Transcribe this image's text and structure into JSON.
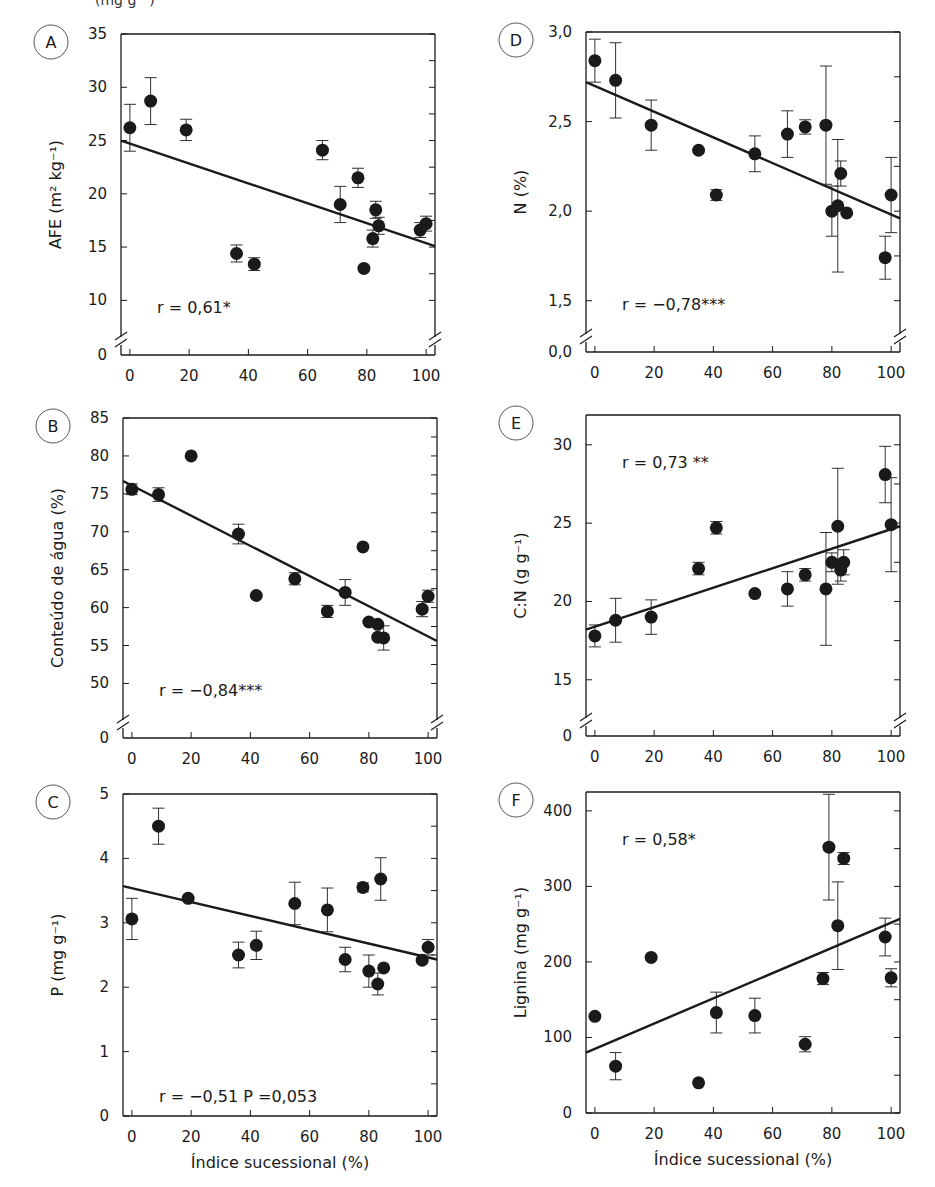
{
  "figure": {
    "top_fragment": "(mg g⁻¹)",
    "x_axis_label": "Índice sucessional (%)",
    "x_ticks": [
      0,
      20,
      40,
      60,
      80,
      100
    ]
  },
  "chart_data": [
    {
      "id": "A",
      "type": "scatter",
      "panel_label": "A",
      "ylabel": "AFE (m² kg⁻¹)",
      "xlabel": "",
      "xlim": [
        -3,
        103
      ],
      "ylim": [
        7.5,
        35
      ],
      "y_ticks": [
        10,
        15,
        20,
        25,
        30,
        35
      ],
      "y_tick_labels": [
        "10",
        "15",
        "20",
        "25",
        "30",
        "35"
      ],
      "axis_break": true,
      "below_break_label": "0",
      "annotation": "r = 0,61*",
      "annotation_pos": "bottom-left",
      "regression": {
        "x0": -3,
        "y0": 25.0,
        "x1": 103,
        "y1": 15.1
      },
      "points": [
        {
          "x": 0,
          "y": 26.2,
          "err": 2.2
        },
        {
          "x": 7,
          "y": 28.7,
          "err": 2.2
        },
        {
          "x": 19,
          "y": 26.0,
          "err": 1.0
        },
        {
          "x": 36,
          "y": 14.4,
          "err": 0.8
        },
        {
          "x": 42,
          "y": 13.4,
          "err": 0.6
        },
        {
          "x": 65,
          "y": 24.1,
          "err": 0.9
        },
        {
          "x": 71,
          "y": 19.0,
          "err": 1.7
        },
        {
          "x": 77,
          "y": 21.5,
          "err": 0.9
        },
        {
          "x": 79,
          "y": 13.0,
          "err": 0
        },
        {
          "x": 82,
          "y": 15.8,
          "err": 0.8
        },
        {
          "x": 83,
          "y": 18.5,
          "err": 0.8
        },
        {
          "x": 84,
          "y": 17.0,
          "err": 0.8
        },
        {
          "x": 98,
          "y": 16.6,
          "err": 0.7
        },
        {
          "x": 100,
          "y": 17.2,
          "err": 0.7
        }
      ]
    },
    {
      "id": "B",
      "type": "scatter",
      "panel_label": "B",
      "ylabel": "Conteúdo de água (%)",
      "xlabel": "",
      "xlim": [
        -3,
        103
      ],
      "ylim": [
        46.5,
        85
      ],
      "y_ticks": [
        50,
        55,
        60,
        65,
        70,
        75,
        80,
        85
      ],
      "y_tick_labels": [
        "50",
        "55",
        "60",
        "65",
        "70",
        "75",
        "80",
        "85"
      ],
      "axis_break": true,
      "below_break_label": "0",
      "annotation": "r = −0,84***",
      "annotation_pos": "bottom-left",
      "regression": {
        "x0": -3,
        "y0": 76.7,
        "x1": 103,
        "y1": 55.6
      },
      "points": [
        {
          "x": 0,
          "y": 75.6,
          "err": 0.7
        },
        {
          "x": 9,
          "y": 74.9,
          "err": 0.9
        },
        {
          "x": 20,
          "y": 80.0,
          "err": 0
        },
        {
          "x": 36,
          "y": 69.7,
          "err": 1.3
        },
        {
          "x": 42,
          "y": 61.6,
          "err": 0
        },
        {
          "x": 55,
          "y": 63.8,
          "err": 0.8
        },
        {
          "x": 66,
          "y": 59.5,
          "err": 0.8
        },
        {
          "x": 72,
          "y": 62.0,
          "err": 1.7
        },
        {
          "x": 78,
          "y": 68.0,
          "err": 0
        },
        {
          "x": 80,
          "y": 58.1,
          "err": 0
        },
        {
          "x": 83,
          "y": 57.8,
          "err": 0
        },
        {
          "x": 83,
          "y": 56.1,
          "err": 0
        },
        {
          "x": 85,
          "y": 56.0,
          "err": 1.6
        },
        {
          "x": 98,
          "y": 59.8,
          "err": 1.0
        },
        {
          "x": 100,
          "y": 61.5,
          "err": 0.8
        }
      ]
    },
    {
      "id": "C",
      "type": "scatter",
      "panel_label": "C",
      "ylabel": "P (mg g⁻¹)",
      "xlabel": "Índice sucessional (%)",
      "xlim": [
        -3,
        103
      ],
      "ylim": [
        0,
        5
      ],
      "y_ticks": [
        0,
        1,
        2,
        3,
        4,
        5
      ],
      "y_tick_labels": [
        "0",
        "1",
        "2",
        "3",
        "4",
        "5"
      ],
      "axis_break": false,
      "annotation": "r = −0,51 P =0,053",
      "annotation_pos": "bottom-left",
      "regression": {
        "x0": -3,
        "y0": 3.57,
        "x1": 103,
        "y1": 2.43
      },
      "points": [
        {
          "x": 0,
          "y": 3.06,
          "err": 0.32
        },
        {
          "x": 9,
          "y": 4.5,
          "err": 0.28
        },
        {
          "x": 19,
          "y": 3.38,
          "err": 0
        },
        {
          "x": 36,
          "y": 2.5,
          "err": 0.2
        },
        {
          "x": 42,
          "y": 2.65,
          "err": 0.22
        },
        {
          "x": 55,
          "y": 3.3,
          "err": 0.33
        },
        {
          "x": 66,
          "y": 3.2,
          "err": 0.34
        },
        {
          "x": 72,
          "y": 2.43,
          "err": 0.19
        },
        {
          "x": 78,
          "y": 3.55,
          "err": 0.07
        },
        {
          "x": 80,
          "y": 2.25,
          "err": 0.25
        },
        {
          "x": 83,
          "y": 2.05,
          "err": 0.17
        },
        {
          "x": 84,
          "y": 3.68,
          "err": 0.33
        },
        {
          "x": 85,
          "y": 2.3,
          "err": 0
        },
        {
          "x": 98,
          "y": 2.42,
          "err": 0
        },
        {
          "x": 100,
          "y": 2.62,
          "err": 0.12
        }
      ]
    },
    {
      "id": "D",
      "type": "scatter",
      "panel_label": "D",
      "ylabel": "N (%)",
      "xlabel": "",
      "xlim": [
        -3,
        103
      ],
      "ylim": [
        1.37,
        3.0
      ],
      "y_ticks": [
        1.5,
        2.0,
        2.5,
        3.0
      ],
      "y_tick_labels": [
        "1,5",
        "2,0",
        "2,5",
        "3,0"
      ],
      "axis_break": true,
      "below_break_label": "0,0",
      "annotation": "r = −0,78***",
      "annotation_pos": "bottom-left",
      "regression": {
        "x0": -3,
        "y0": 2.72,
        "x1": 103,
        "y1": 1.96
      },
      "points": [
        {
          "x": 0,
          "y": 2.84,
          "err": 0.12
        },
        {
          "x": 7,
          "y": 2.73,
          "err": 0.21
        },
        {
          "x": 19,
          "y": 2.48,
          "err": 0.14
        },
        {
          "x": 35,
          "y": 2.34,
          "err": 0
        },
        {
          "x": 41,
          "y": 2.09,
          "err": 0.03
        },
        {
          "x": 54,
          "y": 2.32,
          "err": 0.1
        },
        {
          "x": 65,
          "y": 2.43,
          "err": 0.13
        },
        {
          "x": 71,
          "y": 2.47,
          "err": 0.04
        },
        {
          "x": 78,
          "y": 2.48,
          "err": 0.33
        },
        {
          "x": 80,
          "y": 2.0,
          "err": 0.14
        },
        {
          "x": 82,
          "y": 2.03,
          "err": 0.37
        },
        {
          "x": 83,
          "y": 2.21,
          "err": 0.07
        },
        {
          "x": 85,
          "y": 1.99,
          "err": 0
        },
        {
          "x": 98,
          "y": 1.74,
          "err": 0.12
        },
        {
          "x": 100,
          "y": 2.09,
          "err": 0.21
        }
      ]
    },
    {
      "id": "E",
      "type": "scatter",
      "panel_label": "E",
      "ylabel": "C:N (g g⁻¹)",
      "xlabel": "",
      "xlim": [
        -3,
        103
      ],
      "ylim": [
        13.2,
        31.9
      ],
      "y_ticks": [
        15,
        20,
        25,
        30
      ],
      "y_tick_labels": [
        "15",
        "20",
        "25",
        "30"
      ],
      "axis_break": true,
      "below_break_label": "0",
      "annotation": "r = 0,73 **",
      "annotation_pos": "top-left",
      "regression": {
        "x0": -3,
        "y0": 18.2,
        "x1": 103,
        "y1": 24.8
      },
      "points": [
        {
          "x": 0,
          "y": 17.8,
          "err": 0.7
        },
        {
          "x": 7,
          "y": 18.8,
          "err": 1.4
        },
        {
          "x": 19,
          "y": 19.0,
          "err": 1.1
        },
        {
          "x": 35,
          "y": 22.1,
          "err": 0.4
        },
        {
          "x": 41,
          "y": 24.7,
          "err": 0.4
        },
        {
          "x": 54,
          "y": 20.5,
          "err": 0
        },
        {
          "x": 65,
          "y": 20.8,
          "err": 1.1
        },
        {
          "x": 71,
          "y": 21.7,
          "err": 0.4
        },
        {
          "x": 78,
          "y": 20.8,
          "err": 3.6
        },
        {
          "x": 80,
          "y": 22.5,
          "err": 0.6
        },
        {
          "x": 82,
          "y": 24.8,
          "err": 3.7
        },
        {
          "x": 83,
          "y": 22.0,
          "err": 0.7
        },
        {
          "x": 84,
          "y": 22.5,
          "err": 0.8
        },
        {
          "x": 98,
          "y": 28.1,
          "err": 1.8
        },
        {
          "x": 100,
          "y": 24.9,
          "err": 3.0
        }
      ]
    },
    {
      "id": "F",
      "type": "scatter",
      "panel_label": "F",
      "ylabel": "Lignina (mg g⁻¹)",
      "xlabel": "Índice sucessional (%)",
      "xlim": [
        -3,
        103
      ],
      "ylim": [
        0,
        425
      ],
      "y_ticks": [
        0,
        100,
        200,
        300,
        400
      ],
      "y_tick_labels": [
        "0",
        "100",
        "200",
        "300",
        "400"
      ],
      "axis_break": false,
      "annotation": "r = 0,58*",
      "annotation_pos": "top-left",
      "regression": {
        "x0": -3,
        "y0": 80,
        "x1": 103,
        "y1": 257
      },
      "points": [
        {
          "x": 0,
          "y": 128,
          "err": 0
        },
        {
          "x": 7,
          "y": 62,
          "err": 18
        },
        {
          "x": 19,
          "y": 206,
          "err": 0
        },
        {
          "x": 35,
          "y": 40,
          "err": 0
        },
        {
          "x": 41,
          "y": 133,
          "err": 27
        },
        {
          "x": 54,
          "y": 129,
          "err": 23
        },
        {
          "x": 71,
          "y": 91,
          "err": 10
        },
        {
          "x": 77,
          "y": 178,
          "err": 8
        },
        {
          "x": 79,
          "y": 352,
          "err": 70
        },
        {
          "x": 82,
          "y": 248,
          "err": 58
        },
        {
          "x": 84,
          "y": 337,
          "err": 8
        },
        {
          "x": 98,
          "y": 233,
          "err": 25
        },
        {
          "x": 100,
          "y": 179,
          "err": 12
        }
      ]
    }
  ],
  "colors": {
    "ink": "#1a1a1a",
    "axis": "#333333",
    "background": "#ffffff"
  }
}
